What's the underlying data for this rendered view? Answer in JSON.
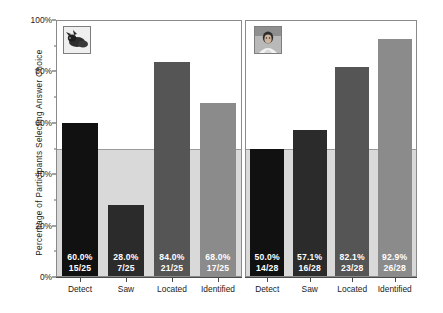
{
  "chart_data": {
    "type": "bar",
    "title": "",
    "xlabel": "",
    "ylabel": "Percentage of Participants Selecting Answer Choice",
    "ylim": [
      0,
      100
    ],
    "ytick_labels": [
      "0%",
      "20%",
      "40%",
      "60%",
      "80%",
      "100%"
    ],
    "ytick_values": [
      0,
      20,
      40,
      60,
      80,
      100
    ],
    "yminor_values": [
      10,
      30,
      50,
      70,
      90
    ],
    "grid": false,
    "legend": "none",
    "reference_line": 50,
    "categories": [
      "Detect",
      "Saw",
      "Located",
      "Identified"
    ],
    "panels": [
      {
        "name": "panel-animal",
        "thumbnail": "animal-photo-icon",
        "values": [
          60.0,
          28.0,
          84.0,
          68.0
        ],
        "labels": [
          {
            "percent": "60.0%",
            "fraction": "15/25"
          },
          {
            "percent": "28.0%",
            "fraction": "7/25"
          },
          {
            "percent": "84.0%",
            "fraction": "21/25"
          },
          {
            "percent": "68.0%",
            "fraction": "17/25"
          }
        ],
        "colors": [
          "#111111",
          "#2b2b2b",
          "#555555",
          "#8b8b8b"
        ]
      },
      {
        "name": "panel-person",
        "thumbnail": "person-photo-icon",
        "values": [
          50.0,
          57.1,
          82.1,
          92.9
        ],
        "labels": [
          {
            "percent": "50.0%",
            "fraction": "14/28"
          },
          {
            "percent": "57.1%",
            "fraction": "16/28"
          },
          {
            "percent": "82.1%",
            "fraction": "23/28"
          },
          {
            "percent": "92.9%",
            "fraction": "26/28"
          }
        ],
        "colors": [
          "#111111",
          "#2b2b2b",
          "#555555",
          "#8b8b8b"
        ]
      }
    ],
    "colors": {
      "background_above_reference": "#ffffff",
      "background_below_reference": "#d9d9d9",
      "panel_border": "#8a8a8a",
      "axis": "#4a4a4a",
      "reference_line": "#9a9a9a",
      "bar_detect": "#111111",
      "bar_saw": "#2b2b2b",
      "bar_located": "#555555",
      "bar_identified": "#8b8b8b",
      "bar_label_text": "#ffffff"
    }
  }
}
